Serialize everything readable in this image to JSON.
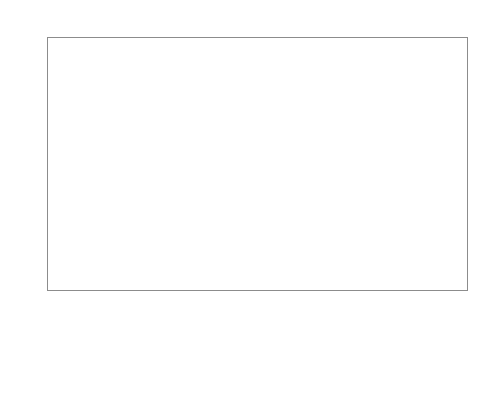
{
  "chart_data": {
    "type": "bar",
    "title": "",
    "subtitle": "",
    "xlabel": "",
    "ylabel": "",
    "ylim": [
      0,
      500
    ],
    "ytick_step": 100,
    "yticks": [
      0,
      100,
      200,
      300,
      400,
      500
    ],
    "ytick_labels": [
      "0",
      "100",
      "200",
      "300",
      "400",
      "500"
    ],
    "grid": "horizontal",
    "legend_position": "top-center",
    "categories": [
      "Sports facilities",
      "Wholesale and retail",
      "Hotel and restaurants",
      "Hospitals",
      "Educational buildings",
      "Offices"
    ],
    "series": [
      {
        "name": "SI",
        "color": "#cccccc",
        "values": [
          110,
          200,
          210,
          272,
          null,
          207
        ]
      },
      {
        "name": "UK",
        "color": "#999999",
        "values": [
          211,
          207,
          428,
          403,
          183,
          316
        ]
      },
      {
        "name": "CZ",
        "color": "#7a7a7a",
        "values": [
          256,
          null,
          402,
          433,
          243,
          281
        ]
      },
      {
        "name": "FR",
        "color": "#4d4d4d",
        "values": [
          null,
          242,
          377,
          252,
          142,
          null
        ]
      },
      {
        "name": "FI",
        "color": "#f2f2f2",
        "values": [
          null,
          331,
          null,
          357,
          null,
          258
        ]
      },
      {
        "name": "BG",
        "color": "#1a1a1a",
        "values": [
          null,
          212,
          325,
          367,
          188,
          217
        ]
      }
    ]
  },
  "legend": {
    "entries": [
      {
        "label": "SI",
        "color": "#cccccc"
      },
      {
        "label": "UK",
        "color": "#999999"
      },
      {
        "label": "CZ",
        "color": "#7a7a7a"
      },
      {
        "label": "FR",
        "color": "#4d4d4d"
      },
      {
        "label": "FI",
        "color": "#f2f2f2"
      },
      {
        "label": "BG",
        "color": "#1a1a1a"
      }
    ]
  },
  "axis": {
    "y_labels": [
      "500",
      "400",
      "300",
      "200",
      "100",
      "0"
    ],
    "x_labels": [
      "Sports facilities",
      "Wholesale and retail",
      "Hotel and restaurants",
      "Hospitals",
      "Educational buildings",
      "Offices"
    ]
  },
  "style": {
    "frame_color": "#8c8c8c",
    "grid_color": "#a8a8a8",
    "background": "#ffffff",
    "text_color": "#111111"
  }
}
